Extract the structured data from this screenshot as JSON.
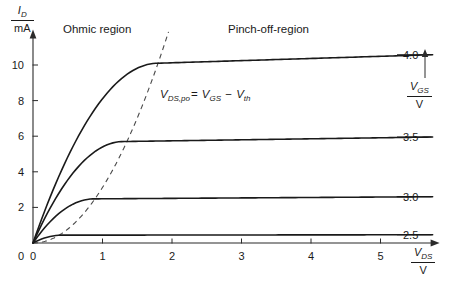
{
  "figure": {
    "background_color": "#ffffff",
    "line_color": "#1a1a1a",
    "locus_color": "#4a4a4a"
  },
  "annotations": {
    "ohmic_region": "Ohmic region",
    "pinchoff_region": "Pinch-off-region",
    "formula": {
      "lhs_main": "V",
      "lhs_sub": "DS,po",
      "equals": "=",
      "rhs1_main": "V",
      "rhs1_sub": "GS",
      "minus": "−",
      "rhs2_main": "V",
      "rhs2_sub": "th"
    }
  },
  "axes": {
    "y": {
      "symbol_main": "I",
      "symbol_sub": "D",
      "unit": "mA",
      "ticks": [
        0,
        2,
        4,
        6,
        8,
        10
      ],
      "tick_labels": [
        "0",
        "2",
        "4",
        "6",
        "8",
        "10"
      ],
      "range": [
        0,
        11.6
      ]
    },
    "x": {
      "symbol_main": "V",
      "symbol_sub": "DS",
      "unit": "V",
      "ticks": [
        0,
        1,
        2,
        3,
        4,
        5
      ],
      "tick_labels": [
        "0",
        "1",
        "2",
        "3",
        "4",
        "5"
      ],
      "range": [
        0,
        5.75
      ]
    }
  },
  "legend": {
    "symbol_main": "V",
    "symbol_sub": "GS",
    "unit": "V",
    "arrow": "up-arrow-icon"
  },
  "chart_data": {
    "type": "line",
    "title": "",
    "xlabel": "V_DS / V",
    "ylabel": "I_D / mA",
    "xlim": [
      0,
      5.75
    ],
    "ylim": [
      0,
      11.6
    ],
    "grid": false,
    "legend_position": "right",
    "parameter": "V_GS / V",
    "series": [
      {
        "name": "4.0",
        "label": "4.0",
        "v_gs": 4.0,
        "i_sat_mA": 10.1,
        "v_knee": 1.8,
        "lambda": 0.012,
        "style": "solid"
      },
      {
        "name": "3.5",
        "label": "3.5",
        "v_gs": 3.5,
        "i_sat_mA": 5.7,
        "v_knee": 1.3,
        "lambda": 0.01,
        "style": "solid"
      },
      {
        "name": "3.0",
        "label": "3.0",
        "v_gs": 3.0,
        "i_sat_mA": 2.48,
        "v_knee": 0.88,
        "lambda": 0.01,
        "style": "solid"
      },
      {
        "name": "2.5",
        "label": "2.5",
        "v_gs": 2.5,
        "i_sat_mA": 0.44,
        "v_knee": 0.42,
        "lambda": 0.01,
        "style": "solid"
      }
    ],
    "locus": {
      "name": "V_DS,po = V_GS - V_th",
      "style": "dashed",
      "description": "pinch-off locus, parabola I = k*Vds^2 through the knees",
      "k_mA_per_V2": 3.12,
      "v_max": 1.95
    }
  }
}
